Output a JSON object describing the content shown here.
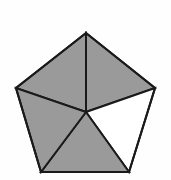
{
  "figure": {
    "name": "pentagon-five-triangle-partition",
    "shape": "regular-pentagon",
    "canvas": {
      "width": 171,
      "height": 180,
      "background": "#fefefe"
    },
    "style": {
      "fill_shaded": "#9a9a9a",
      "fill_unshaded": "#ffffff",
      "stroke": "#1a1a1a",
      "stroke_width": 2
    },
    "counts": {
      "total_triangles": 5,
      "shaded_triangles": 4,
      "unshaded_triangles": 1
    },
    "center": {
      "label": "center",
      "x": 86,
      "y": 112
    },
    "vertices": [
      {
        "label": "top",
        "x": 86,
        "y": 33
      },
      {
        "label": "right",
        "x": 155,
        "y": 88
      },
      {
        "label": "bottom-right",
        "x": 129,
        "y": 172
      },
      {
        "label": "bottom-left",
        "x": 41,
        "y": 172
      },
      {
        "label": "left",
        "x": 16,
        "y": 88
      }
    ],
    "triangles": [
      {
        "name": "triangle-top-right",
        "vertex_labels": [
          "center",
          "top",
          "right"
        ],
        "points": "86,112 86,33 155,88",
        "shaded": true,
        "fill": "#9a9a9a"
      },
      {
        "name": "triangle-right",
        "vertex_labels": [
          "center",
          "right",
          "bottom-right"
        ],
        "points": "86,112 155,88 129,172",
        "shaded": false,
        "fill": "#ffffff"
      },
      {
        "name": "triangle-bottom",
        "vertex_labels": [
          "center",
          "bottom-right",
          "bottom-left"
        ],
        "points": "86,112 129,172 41,172",
        "shaded": true,
        "fill": "#9a9a9a"
      },
      {
        "name": "triangle-bottom-left",
        "vertex_labels": [
          "center",
          "bottom-left",
          "left"
        ],
        "points": "86,112 41,172 16,88",
        "shaded": true,
        "fill": "#9a9a9a"
      },
      {
        "name": "triangle-top-left",
        "vertex_labels": [
          "center",
          "left",
          "top"
        ],
        "points": "86,112 16,88 86,33",
        "shaded": true,
        "fill": "#9a9a9a"
      }
    ],
    "outline": {
      "name": "pentagon-outline",
      "points": "86,33 155,88 129,172 41,172 16,88"
    }
  }
}
